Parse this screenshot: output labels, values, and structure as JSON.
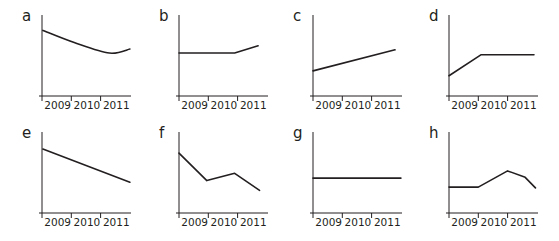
{
  "chart_data": [
    {
      "id": "a",
      "type": "line",
      "title": "a",
      "xlabel": "",
      "ylabel": "",
      "categories": [
        "2009",
        "2010",
        "2011"
      ],
      "grid": false,
      "x": [
        0.03,
        1.1,
        2.3,
        3.0
      ],
      "values": [
        81,
        66,
        53,
        58
      ],
      "smooth": true,
      "ylim": [
        0,
        100
      ]
    },
    {
      "id": "b",
      "type": "line",
      "title": "b",
      "xlabel": "",
      "ylabel": "",
      "categories": [
        "2009",
        "2010",
        "2011"
      ],
      "grid": false,
      "x": [
        0,
        1.9,
        2.7
      ],
      "values": [
        53,
        53,
        62
      ],
      "smooth": false,
      "ylim": [
        0,
        100
      ]
    },
    {
      "id": "c",
      "type": "line",
      "title": "c",
      "xlabel": "",
      "ylabel": "",
      "categories": [
        "2009",
        "2010",
        "2011"
      ],
      "grid": false,
      "x": [
        0,
        2.8
      ],
      "values": [
        31,
        57
      ],
      "smooth": false,
      "ylim": [
        0,
        100
      ]
    },
    {
      "id": "d",
      "type": "line",
      "title": "d",
      "xlabel": "",
      "ylabel": "",
      "categories": [
        "2009",
        "2010",
        "2011"
      ],
      "grid": false,
      "x": [
        0,
        1.1,
        2.9
      ],
      "values": [
        25,
        51,
        51
      ],
      "smooth": false,
      "ylim": [
        0,
        100
      ]
    },
    {
      "id": "e",
      "type": "line",
      "title": "e",
      "xlabel": "",
      "ylabel": "",
      "categories": [
        "2009",
        "2010",
        "2011"
      ],
      "grid": false,
      "x": [
        0.03,
        3.0
      ],
      "values": [
        79,
        38
      ],
      "smooth": false,
      "ylim": [
        0,
        100
      ]
    },
    {
      "id": "f",
      "type": "line",
      "title": "f",
      "xlabel": "",
      "ylabel": "",
      "categories": [
        "2009",
        "2010",
        "2011"
      ],
      "grid": false,
      "x": [
        0,
        0.95,
        1.9,
        2.75
      ],
      "values": [
        74,
        40,
        49,
        28
      ],
      "smooth": false,
      "ylim": [
        0,
        100
      ]
    },
    {
      "id": "g",
      "type": "line",
      "title": "g",
      "xlabel": "",
      "ylabel": "",
      "categories": [
        "2009",
        "2010",
        "2011"
      ],
      "grid": false,
      "x": [
        0,
        3.0
      ],
      "values": [
        43,
        43
      ],
      "smooth": false,
      "ylim": [
        0,
        100
      ]
    },
    {
      "id": "h",
      "type": "line",
      "title": "h",
      "xlabel": "",
      "ylabel": "",
      "categories": [
        "2009",
        "2010",
        "2011"
      ],
      "grid": false,
      "x": [
        0,
        1.0,
        2.0,
        2.6,
        2.95
      ],
      "values": [
        32,
        32,
        52,
        44,
        31
      ],
      "smooth": false,
      "ylim": [
        0,
        100
      ]
    }
  ],
  "panels": {
    "labels": [
      "a",
      "b",
      "c",
      "d",
      "e",
      "f",
      "g",
      "h"
    ],
    "year_labels": [
      "2009",
      "2010",
      "2011"
    ]
  },
  "colors": {
    "ink": "#231f20",
    "background": "#ffffff"
  }
}
